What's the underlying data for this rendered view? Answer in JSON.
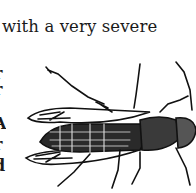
{
  "document": {
    "text_line": "with a very severe",
    "left_margin_fragments": [
      "r",
      "r",
      "A",
      "r",
      "d"
    ],
    "figure": {
      "subject": "wasp-illustration",
      "style": "black ink engraving"
    }
  }
}
